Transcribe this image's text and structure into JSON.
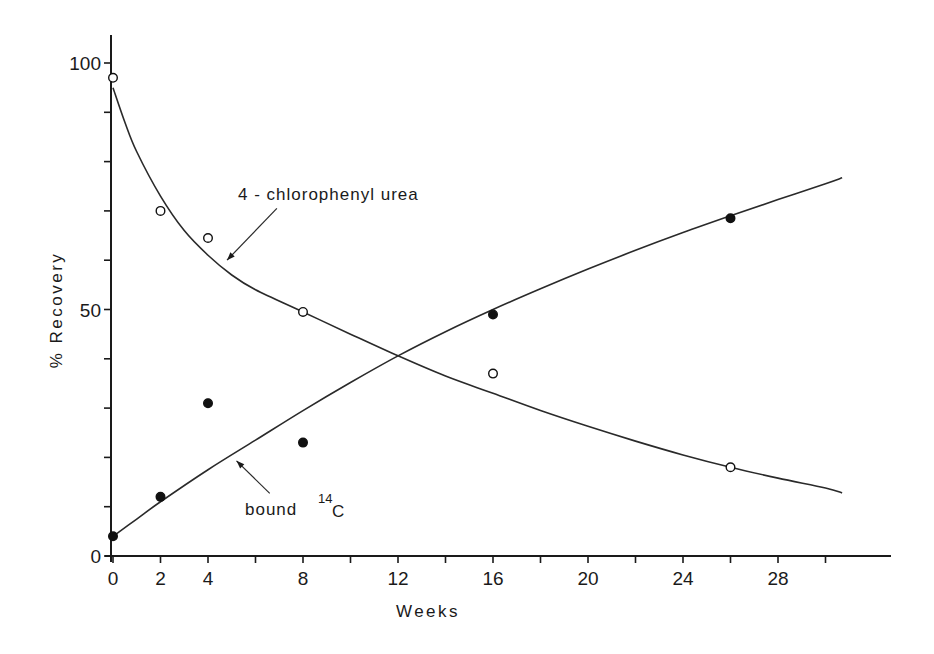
{
  "chart_data": {
    "type": "line",
    "title": "",
    "xlabel": "Weeks",
    "ylabel": "% Recovery",
    "xlim": [
      0,
      32
    ],
    "ylim": [
      0,
      105
    ],
    "x_ticks": [
      0,
      2,
      4,
      6,
      8,
      10,
      12,
      14,
      16,
      18,
      20,
      22,
      24,
      26,
      28,
      30
    ],
    "x_tick_labels": [
      {
        "value": 0,
        "label": "0"
      },
      {
        "value": 2,
        "label": "2"
      },
      {
        "value": 4,
        "label": "4"
      },
      {
        "value": 8,
        "label": "8"
      },
      {
        "value": 12,
        "label": "12"
      },
      {
        "value": 16,
        "label": "16"
      },
      {
        "value": 20,
        "label": "20"
      },
      {
        "value": 24,
        "label": "24"
      },
      {
        "value": 28,
        "label": "28"
      }
    ],
    "y_ticks": [
      0,
      10,
      20,
      30,
      40,
      50,
      60,
      70,
      80,
      90,
      100
    ],
    "y_tick_labels": [
      {
        "value": 0,
        "label": "0"
      },
      {
        "value": 50,
        "label": "50"
      },
      {
        "value": 100,
        "label": "100"
      }
    ],
    "grid": false,
    "legend": null,
    "series": [
      {
        "name": "4-chlorophenyl urea",
        "marker": "open-circle",
        "points": [
          {
            "x": 0,
            "y": 97
          },
          {
            "x": 2,
            "y": 70
          },
          {
            "x": 4,
            "y": 64.5
          },
          {
            "x": 8,
            "y": 49.5
          },
          {
            "x": 16,
            "y": 37
          },
          {
            "x": 26,
            "y": 18
          }
        ],
        "fit_curve": [
          {
            "x": 0,
            "y": 95
          },
          {
            "x": 0.5,
            "y": 88
          },
          {
            "x": 1,
            "y": 82
          },
          {
            "x": 2,
            "y": 73
          },
          {
            "x": 3,
            "y": 66
          },
          {
            "x": 4,
            "y": 61
          },
          {
            "x": 5,
            "y": 57
          },
          {
            "x": 6,
            "y": 54
          },
          {
            "x": 8,
            "y": 49.5
          },
          {
            "x": 10,
            "y": 45
          },
          {
            "x": 12,
            "y": 40.6
          },
          {
            "x": 14,
            "y": 36.5
          },
          {
            "x": 16,
            "y": 33
          },
          {
            "x": 18,
            "y": 29.5
          },
          {
            "x": 20,
            "y": 26.3
          },
          {
            "x": 22,
            "y": 23.3
          },
          {
            "x": 24,
            "y": 20.5
          },
          {
            "x": 26,
            "y": 18
          },
          {
            "x": 28,
            "y": 15.8
          },
          {
            "x": 30,
            "y": 13.8
          },
          {
            "x": 30.7,
            "y": 12.8
          }
        ]
      },
      {
        "name": "bound 14C",
        "marker": "filled-circle",
        "points": [
          {
            "x": 0,
            "y": 4
          },
          {
            "x": 2,
            "y": 12
          },
          {
            "x": 4,
            "y": 31
          },
          {
            "x": 8,
            "y": 23
          },
          {
            "x": 16,
            "y": 49
          },
          {
            "x": 26,
            "y": 68.5
          }
        ],
        "fit_curve": [
          {
            "x": 0,
            "y": 4
          },
          {
            "x": 1,
            "y": 7.5
          },
          {
            "x": 2,
            "y": 11
          },
          {
            "x": 4,
            "y": 17.5
          },
          {
            "x": 6,
            "y": 23.5
          },
          {
            "x": 8,
            "y": 29.5
          },
          {
            "x": 10,
            "y": 35.2
          },
          {
            "x": 12,
            "y": 40.6
          },
          {
            "x": 14,
            "y": 45.5
          },
          {
            "x": 16,
            "y": 50
          },
          {
            "x": 18,
            "y": 54.2
          },
          {
            "x": 20,
            "y": 58.2
          },
          {
            "x": 22,
            "y": 62
          },
          {
            "x": 24,
            "y": 65.6
          },
          {
            "x": 26,
            "y": 69
          },
          {
            "x": 28,
            "y": 72.3
          },
          {
            "x": 30,
            "y": 75.5
          },
          {
            "x": 30.7,
            "y": 76.7
          }
        ]
      }
    ],
    "annotations": [
      {
        "text": "4-chlorophenyl urea",
        "label_x": 5.2,
        "label_y": 73.5,
        "arrow_from": [
          6.9,
          70.5
        ],
        "arrow_to": [
          4.8,
          60
        ]
      },
      {
        "text": "bound",
        "superscript": "14",
        "suffix": "C",
        "label_x": 5.5,
        "label_y": 9,
        "arrow_from": [
          6.6,
          12.7
        ],
        "arrow_to": [
          5.2,
          19.3
        ]
      }
    ]
  },
  "labels": {
    "xlabel": "Weeks",
    "ylabel": "% Recovery",
    "urea_annotation": "4 - chlorophenyl  urea",
    "bound_annotation": "bound",
    "bound_superscript": "14",
    "bound_suffix": "C"
  }
}
